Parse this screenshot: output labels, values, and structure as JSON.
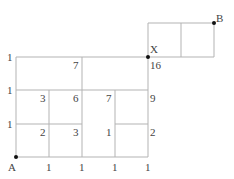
{
  "diagram": {
    "points": {
      "A": {
        "label": "A"
      },
      "X": {
        "label": "X"
      },
      "B": {
        "label": "B"
      }
    },
    "left_edge_labels": [
      "1",
      "1",
      "1"
    ],
    "bottom_edge_labels": [
      "1",
      "1",
      "1",
      "1"
    ],
    "cell_counts": {
      "r3c1": "2",
      "r3c2": "3",
      "r3c3": "1",
      "r3c4": "2",
      "r2c1": "3",
      "r2c2": "6",
      "r2c3": "7",
      "r2c4": "9",
      "r1c2": "7",
      "r1c4": "16"
    }
  }
}
